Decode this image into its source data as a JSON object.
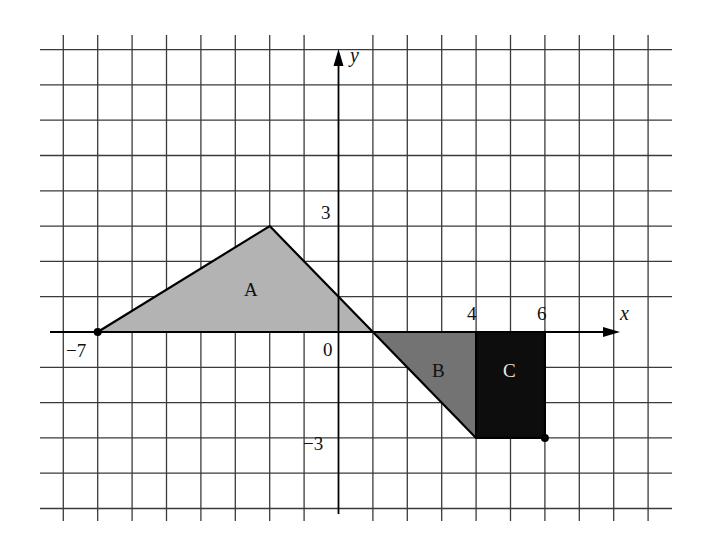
{
  "diagram": {
    "type": "coordinate-grid",
    "axes": {
      "x_label": "x",
      "y_label": "y",
      "x_range": [
        -8,
        9
      ],
      "y_range": [
        -5,
        8
      ],
      "origin_label": "0",
      "tick_labels": {
        "x_neg7": "−7",
        "x_4": "4",
        "x_6": "6",
        "y_3": "3",
        "y_neg3": "−3"
      }
    },
    "shapes": [
      {
        "label": "A",
        "kind": "triangle",
        "vertices": [
          [
            -7,
            0
          ],
          [
            -2,
            3
          ],
          [
            1,
            0
          ]
        ],
        "fill": "#b3b3b3"
      },
      {
        "label": "B",
        "kind": "triangle",
        "vertices": [
          [
            1,
            0
          ],
          [
            4,
            0
          ],
          [
            4,
            -3
          ]
        ],
        "fill": "#737373"
      },
      {
        "label": "C",
        "kind": "rectangle",
        "vertices": [
          [
            4,
            0
          ],
          [
            6,
            0
          ],
          [
            6,
            -3
          ],
          [
            4,
            -3
          ]
        ],
        "fill": "#0d0d0d"
      }
    ],
    "points": [
      {
        "name": "point-neg7-0",
        "coords": [
          -7,
          0
        ]
      },
      {
        "name": "point-6-neg3",
        "coords": [
          6,
          -3
        ]
      }
    ],
    "colors": {
      "grid": "#3a3a3a",
      "axis": "#000000",
      "shape_a": "#b3b3b3",
      "shape_b": "#737373",
      "shape_c": "#0d0d0d",
      "label_on_dark": "#e6e6e6"
    }
  }
}
